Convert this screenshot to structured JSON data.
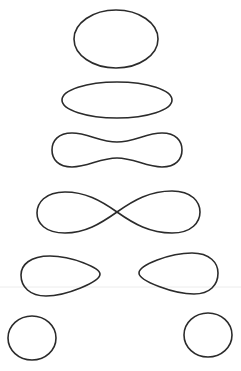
{
  "diagram": {
    "type": "level-set-curves",
    "stroke_color": "#2b2b2b",
    "background": "#ffffff",
    "curves": [
      {
        "name": "oval-top",
        "shape": "ellipse",
        "cx": 116,
        "cy": 39,
        "rx": 42,
        "ry": 29
      },
      {
        "name": "flat-ellipse",
        "shape": "ellipse",
        "cx": 117,
        "cy": 100,
        "rx": 55,
        "ry": 18
      },
      {
        "name": "peanut",
        "shape": "dumbbell",
        "x_range": [
          52,
          182
        ],
        "y_range": [
          132,
          168
        ],
        "waist": [
          142,
          158
        ]
      },
      {
        "name": "lemniscate",
        "shape": "figure-eight",
        "x_range": [
          37,
          200
        ],
        "y_range": [
          191,
          234
        ],
        "crossing": [
          117,
          212
        ]
      },
      {
        "name": "teardrop-left",
        "shape": "teardrop",
        "x_range": [
          21,
          100
        ],
        "y_range": [
          255,
          296
        ]
      },
      {
        "name": "teardrop-right",
        "shape": "teardrop",
        "x_range": [
          139,
          218
        ],
        "y_range": [
          253,
          294
        ]
      },
      {
        "name": "circle-left",
        "shape": "ellipse",
        "cx": 32,
        "cy": 338,
        "rx": 24,
        "ry": 22
      },
      {
        "name": "circle-right",
        "shape": "ellipse",
        "cx": 208,
        "cy": 335,
        "rx": 24,
        "ry": 22
      }
    ]
  }
}
